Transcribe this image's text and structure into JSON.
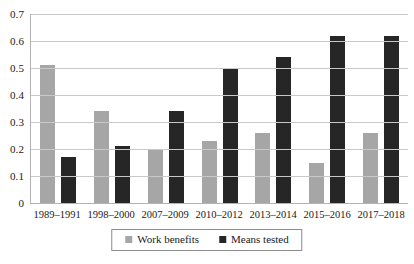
{
  "chart_data": {
    "type": "bar",
    "title": "",
    "subtitle": "",
    "xlabel": "",
    "ylabel": "",
    "ylim": [
      0,
      0.7
    ],
    "y_ticks": [
      "0",
      "0.1",
      "0.2",
      "0.3",
      "0.4",
      "0.5",
      "0.6",
      "0.7"
    ],
    "y_tick_values": [
      0,
      0.1,
      0.2,
      0.3,
      0.4,
      0.5,
      0.6,
      0.7
    ],
    "grid": "horizontal",
    "legend_position": "bottom",
    "categories": [
      "1989–1991",
      "1998–2000",
      "2007–2009",
      "2010–2012",
      "2013–2014",
      "2015–2016",
      "2017–2018"
    ],
    "series": [
      {
        "name": "Work benefits",
        "color": "#a6a6a6",
        "values": [
          0.51,
          0.34,
          0.2,
          0.23,
          0.26,
          0.15,
          0.26
        ]
      },
      {
        "name": "Means tested",
        "color": "#262626",
        "values": [
          0.17,
          0.21,
          0.34,
          0.5,
          0.54,
          0.62,
          0.62
        ]
      }
    ]
  },
  "legend": {
    "items": [
      {
        "label": "Work benefits",
        "color": "#a6a6a6"
      },
      {
        "label": "Means tested",
        "color": "#262626"
      }
    ]
  },
  "colors": {
    "work_benefits": "#a6a6a6",
    "means_tested": "#262626",
    "gridline": "#c8c8c8",
    "axis": "#b3b3b3",
    "background": "#ffffff",
    "text": "#1a1a1a"
  }
}
